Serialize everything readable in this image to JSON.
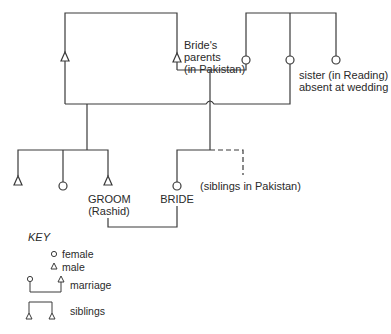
{
  "diagram": {
    "type": "kinship-chart",
    "labels": {
      "brides_parents_line1": "Bride's",
      "brides_parents_line2": "parents",
      "brides_parents_line3": "(in Pakistan)",
      "sister_line1": "sister (in Reading)",
      "sister_line2": "absent at wedding",
      "siblings_pakistan": "(siblings in Pakistan)",
      "groom_line1": "GROOM",
      "groom_line2": "(Rashid)",
      "bride": "BRIDE"
    },
    "people": [
      {
        "id": "groom-father",
        "sex": "male"
      },
      {
        "id": "bride-father",
        "sex": "male"
      },
      {
        "id": "bride-mother",
        "sex": "female"
      },
      {
        "id": "groom-mother",
        "sex": "female"
      },
      {
        "id": "sister-in-reading",
        "sex": "female"
      },
      {
        "id": "groom-brother",
        "sex": "male"
      },
      {
        "id": "groom-sister",
        "sex": "female"
      },
      {
        "id": "groom",
        "sex": "male"
      },
      {
        "id": "bride",
        "sex": "female"
      }
    ]
  },
  "key": {
    "title": "KEY",
    "items": [
      {
        "symbol": "circle",
        "label": "female"
      },
      {
        "symbol": "triangle",
        "label": "male"
      },
      {
        "symbol": "marriage-bracket",
        "label": "marriage"
      },
      {
        "symbol": "siblings-bracket",
        "label": "siblings"
      }
    ]
  }
}
